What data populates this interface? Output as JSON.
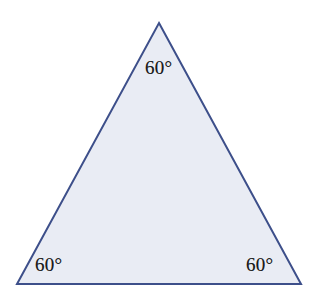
{
  "figure": {
    "type": "equilateral-triangle",
    "background_color": "#ffffff",
    "stroke_color": "#3d4f8a",
    "stroke_width": 2,
    "fill_color": "#e9ecf4",
    "label_color": "#1c1c1c",
    "vertices": {
      "apex": {
        "x": 159,
        "y": 23
      },
      "bottom_left": {
        "x": 17,
        "y": 284
      },
      "bottom_right": {
        "x": 301,
        "y": 284
      }
    },
    "angle_labels": {
      "apex": "60°",
      "bottom_left": "60°",
      "bottom_right": "60°"
    }
  }
}
